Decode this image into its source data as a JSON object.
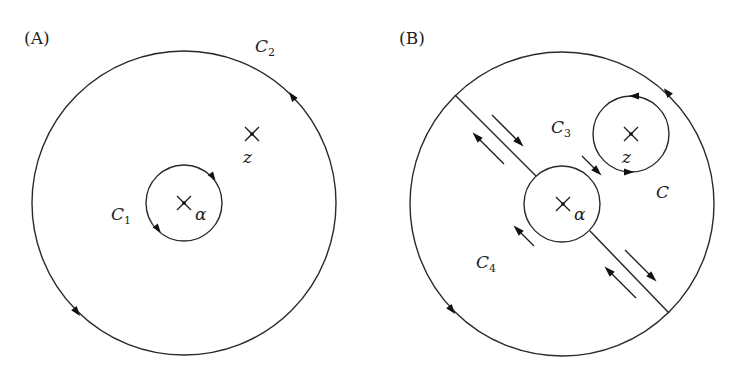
{
  "figure": {
    "panels": [
      {
        "id": "A",
        "label": "(A)",
        "outer_contour": {
          "name": "C",
          "subscript": "2",
          "orientation": "counterclockwise"
        },
        "inner_contour": {
          "name": "C",
          "subscript": "1",
          "orientation": "clockwise"
        },
        "points": [
          {
            "symbol": "α",
            "marker": "cross"
          },
          {
            "symbol": "z",
            "marker": "cross"
          }
        ]
      },
      {
        "id": "B",
        "label": "(B)",
        "outer_contour": {
          "name": "C",
          "subscript": "",
          "orientation": "counterclockwise"
        },
        "regions": [
          {
            "name": "C",
            "subscript": "3"
          },
          {
            "name": "C",
            "subscript": "4"
          }
        ],
        "points": [
          {
            "symbol": "α",
            "marker": "cross"
          },
          {
            "symbol": "z",
            "marker": "cross"
          }
        ],
        "cut_line": "diagonal slit through α joining outer circle, traversed in both directions"
      }
    ]
  },
  "colors": {
    "stroke": "#2a2a2a",
    "background": "#ffffff"
  }
}
